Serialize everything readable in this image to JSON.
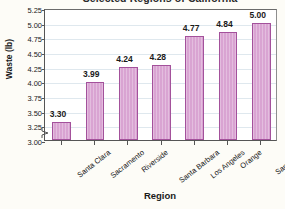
{
  "chart_data": {
    "type": "bar",
    "title": "Selected Regions of California",
    "xlabel": "Region",
    "ylabel": "Waste (lb)",
    "categories": [
      "Santa Clara",
      "Sacramento",
      "Riverside",
      "Santa Barbara",
      "Los Angeles",
      "Orange",
      "San Diego"
    ],
    "values": [
      3.3,
      3.99,
      4.24,
      4.28,
      4.77,
      4.84,
      5.0
    ],
    "value_labels": [
      "3.30",
      "3.99",
      "4.24",
      "4.28",
      "4.77",
      "4.84",
      "5.00"
    ],
    "ylim": [
      3.0,
      5.25
    ],
    "yticks": [
      3.0,
      3.25,
      3.5,
      3.75,
      4.0,
      4.25,
      4.5,
      4.75,
      5.0,
      5.25
    ],
    "ytick_labels": [
      "3.00",
      "3.25",
      "3.50",
      "3.75",
      "4.00",
      "4.25",
      "4.50",
      "4.75",
      "5.00",
      "5.25"
    ],
    "grid": true,
    "axis_break": true,
    "legend": null,
    "colors": {
      "bar_fill": "#d9a4d2",
      "bar_border": "#a3519b",
      "gridline": "#dfe8ee",
      "axis": "#555555",
      "plot_background": "#ffffff",
      "page_background": "#fdfcf7",
      "text": "#1a1a1a"
    }
  }
}
